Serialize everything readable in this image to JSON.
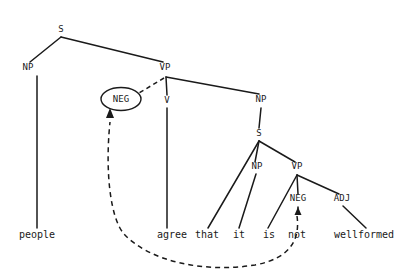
{
  "diagram": {
    "type": "syntax-tree",
    "title": "",
    "sentence": "people agree that it is not wellformed",
    "colors": {
      "ink": "#1a1a1a",
      "background": "#ffffff"
    },
    "nodes": {
      "s_root": {
        "label": "S",
        "x": 61,
        "y": 32
      },
      "np_subject": {
        "label": "NP",
        "x": 28,
        "y": 70
      },
      "vp_main": {
        "label": "VP",
        "x": 165,
        "y": 70
      },
      "neg_circled": {
        "label": "NEG",
        "x": 121,
        "y": 102
      },
      "v_main": {
        "label": "V",
        "x": 167,
        "y": 103
      },
      "np_object": {
        "label": "NP",
        "x": 261,
        "y": 102
      },
      "s_embedded": {
        "label": "S",
        "x": 259,
        "y": 136
      },
      "np_embedded": {
        "label": "NP",
        "x": 257,
        "y": 169
      },
      "vp_embedded": {
        "label": "VP",
        "x": 297,
        "y": 169
      },
      "neg_embedded": {
        "label": "NEG",
        "x": 298,
        "y": 201
      },
      "adj": {
        "label": "ADJ",
        "x": 342,
        "y": 201
      }
    },
    "leaves": [
      {
        "label": "people",
        "x": 37,
        "y": 238
      },
      {
        "label": "agree",
        "x": 172,
        "y": 238
      },
      {
        "label": "that",
        "x": 207,
        "y": 238
      },
      {
        "label": "it",
        "x": 239,
        "y": 238
      },
      {
        "label": "is",
        "x": 269,
        "y": 238
      },
      {
        "label": "not",
        "x": 297,
        "y": 238
      },
      {
        "label": "wellformed",
        "x": 364,
        "y": 238
      }
    ],
    "annotations": {
      "movement_arrow_label": "neg-raising-movement",
      "circled_node_label": "NEG"
    }
  }
}
